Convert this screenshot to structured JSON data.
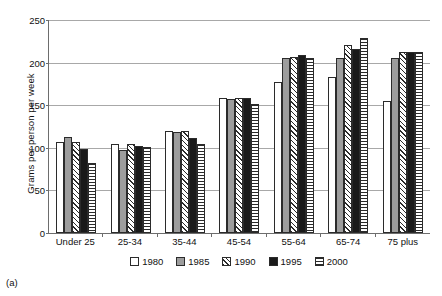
{
  "caption": "(a)",
  "chart_data": {
    "type": "bar",
    "title": "",
    "xlabel": "",
    "ylabel": "Grams per person per week",
    "ylim": [
      0,
      250
    ],
    "yticks": [
      0,
      50,
      100,
      150,
      200,
      250
    ],
    "grid": true,
    "legend_position": "bottom",
    "categories": [
      "Under 25",
      "25-34",
      "35-44",
      "45-54",
      "55-64",
      "65-74",
      "75 plus"
    ],
    "series": [
      {
        "name": "1980",
        "fill": "white",
        "values": [
          107,
          105,
          120,
          159,
          177,
          183,
          155
        ]
      },
      {
        "name": "1985",
        "fill": "solid-gray",
        "values": [
          113,
          98,
          119,
          157,
          205,
          205,
          205
        ]
      },
      {
        "name": "1990",
        "fill": "diagonal-hatch",
        "values": [
          107,
          105,
          120,
          159,
          207,
          221,
          212
        ]
      },
      {
        "name": "1995",
        "fill": "black",
        "values": [
          99,
          102,
          112,
          158,
          209,
          216,
          213
        ]
      },
      {
        "name": "2000",
        "fill": "horizontal-lines",
        "values": [
          82,
          101,
          104,
          152,
          206,
          229,
          213
        ]
      }
    ],
    "colors": {
      "s1980": "#ffffff",
      "s1985": "#9d9d9d",
      "s1990": "#ffffff",
      "s1995": "#1a1a1a",
      "s2000": "#ffffff",
      "outline": "#2b2b2b",
      "axis": "#6d6d6d",
      "grid": "#a8a8a8"
    }
  }
}
